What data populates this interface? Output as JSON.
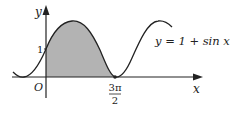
{
  "figure": {
    "equation": "y = 1 + sin x",
    "axis_x_label": "x",
    "axis_y_label": "y",
    "origin_label": "O",
    "y_tick_label": "1",
    "x_tick_numerator": "3π",
    "x_tick_denominator": "2",
    "shaded_region": "area under y = 1 + sin x from x = 0 to x = 3π/2",
    "colors": {
      "curve": "#222222",
      "shade": "#b3b3b3",
      "axes": "#222222"
    }
  }
}
